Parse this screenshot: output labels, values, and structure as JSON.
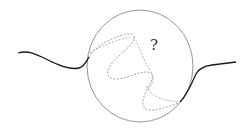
{
  "diagram": {
    "label": "?",
    "colors": {
      "solid_curve": "#1a1a1a",
      "circle": "#8a8a8a",
      "dashed_path": "#9a9a9a",
      "label": "#333333",
      "background": "#ffffff"
    },
    "elements": [
      {
        "name": "left-solid-curve",
        "style": "solid"
      },
      {
        "name": "unknown-region-circle",
        "style": "outline"
      },
      {
        "name": "hidden-dashed-path",
        "style": "dashed"
      },
      {
        "name": "right-solid-curve",
        "style": "solid"
      },
      {
        "name": "question-mark-label",
        "text": "?"
      }
    ]
  }
}
